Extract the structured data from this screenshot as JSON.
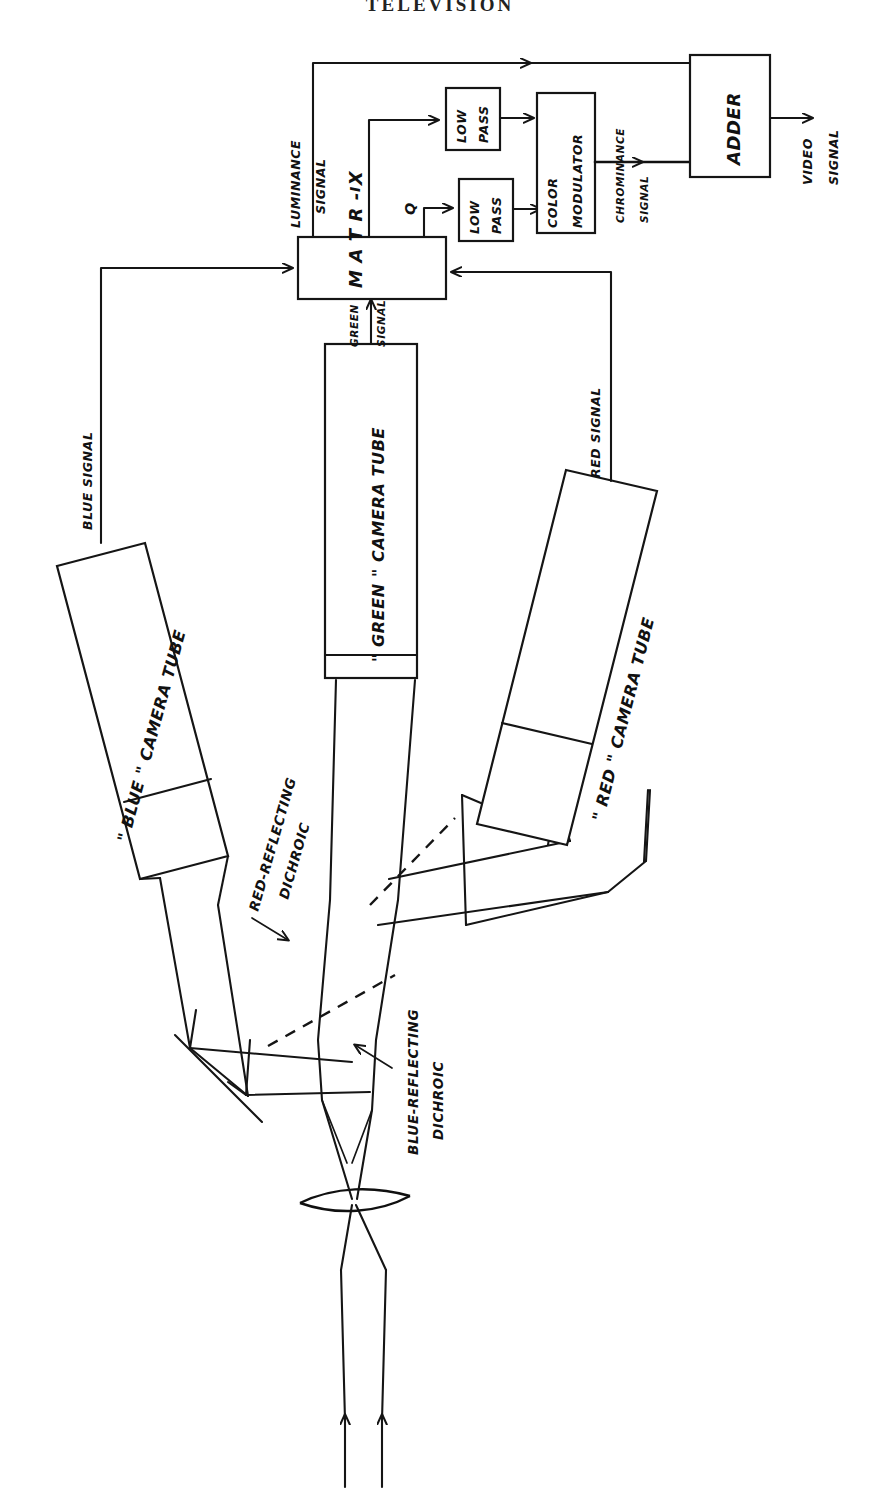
{
  "page": {
    "title": "TELEVISION",
    "orientation": "rotated-90",
    "figure_kind": "hand-drawn block diagram of a three-tube color television camera"
  },
  "colors": {
    "ink": "#151515",
    "paper": "#ffffff"
  },
  "blocks": [
    {
      "id": "matrix",
      "label": "MATRIX",
      "label_spaced": "M A T R - X"
    },
    {
      "id": "low-pass-i",
      "label_line1": "LOW",
      "label_line2": "PASS"
    },
    {
      "id": "low-pass-q",
      "label_line1": "LOW",
      "label_line2": "PASS"
    },
    {
      "id": "color-mod",
      "label_line1": "COLOR",
      "label_line2": "MODULATOR"
    },
    {
      "id": "adder",
      "label": "ADDER"
    },
    {
      "id": "green-tube",
      "label": "\" GREEN \" CAMERA TUBE"
    },
    {
      "id": "blue-tube",
      "label": "\" BLUE \" CAMERA TUBE"
    },
    {
      "id": "red-tube",
      "label": "\" RED \" CAMERA TUBE"
    }
  ],
  "signal_labels": {
    "luminance_line1": "LUMINANCE",
    "luminance_line2": "SIGNAL",
    "i_channel": "I",
    "q_channel": "Q",
    "chrominance_line1": "CHROMINANCE",
    "chrominance_line2": "SIGNAL",
    "video_line1": "VIDEO",
    "video_line2": "SIGNAL",
    "green_line1": "GREEN",
    "green_line2": "SIGNAL",
    "blue": "BLUE SIGNAL",
    "red": "RED SIGNAL"
  },
  "optics_labels": {
    "red_dichroic_line1": "RED-REFLECTING",
    "red_dichroic_line2": "DICHROIC",
    "blue_dichroic_line1": "BLUE-REFLECTING",
    "blue_dichroic_line2": "DICHROIC"
  },
  "tube_labels": {
    "green": "\" GREEN \" CAMERA TUBE",
    "blue": "\" BLUE \" CAMERA TUBE",
    "red": "\" RED \" CAMERA TUBE"
  },
  "tube_label_parts": {
    "green_quoted": "GREEN",
    "blue_quoted": "BLUE",
    "red_quoted": "RED",
    "suffix": "CAMERA TUBE"
  }
}
